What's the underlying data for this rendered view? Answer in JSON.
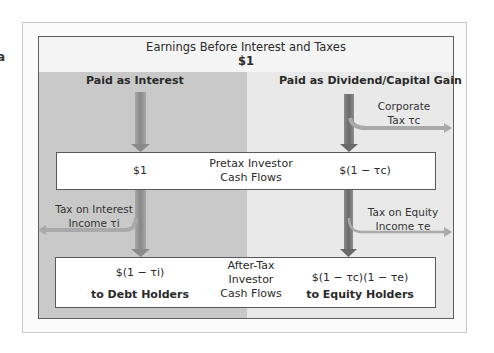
{
  "edge_glyph": "a",
  "header": {
    "title": "Earnings Before Interest and Taxes",
    "value": "$1"
  },
  "columns": {
    "left_title": "Paid as Interest",
    "right_title": "Paid as Dividend/Capital Gain"
  },
  "corporate_tax": {
    "line1": "Corporate",
    "line2": "Tax τc"
  },
  "pretax_box": {
    "left_value": "$1",
    "label_line1": "Pretax Investor",
    "label_line2": "Cash Flows",
    "right_value": "$(1 − τc)"
  },
  "interest_tax": {
    "line1": "Tax on Interest",
    "line2": "Income τi"
  },
  "equity_tax": {
    "line1": "Tax on Equity",
    "line2": "Income τe"
  },
  "aftertax_box": {
    "left_value": "$(1 − τi)",
    "left_recipient": "to Debt Holders",
    "label_line1": "After-Tax",
    "label_line2": "Investor",
    "label_line3": "Cash Flows",
    "right_value": "$(1 − τc)(1 − τe)",
    "right_recipient": "to Equity Holders"
  },
  "colors": {
    "left_column": "#c9c9c9",
    "right_column": "#e9e9e9",
    "header_band": "#f4f4f4",
    "arrow_dark": "#6f6f6f",
    "arrow_light": "#a9a9a9"
  }
}
